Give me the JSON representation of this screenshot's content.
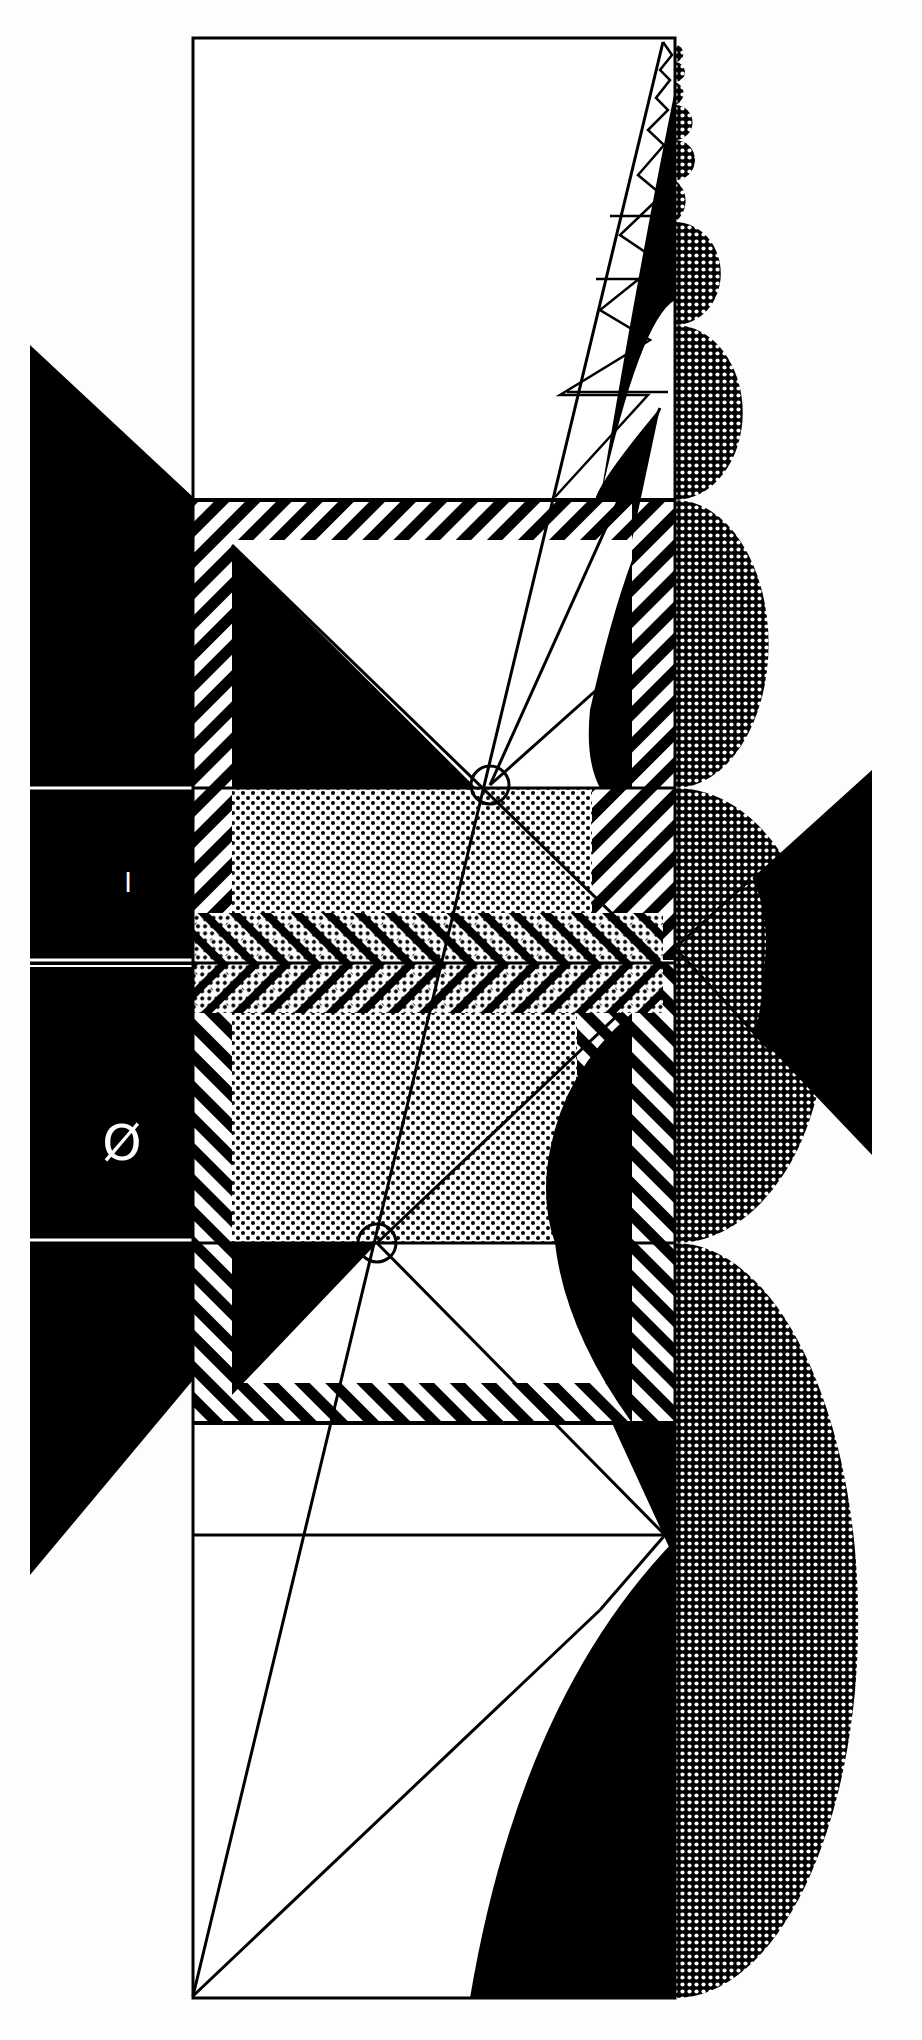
{
  "artwork": {
    "background": "#fdfdfd",
    "ink": "#000000",
    "paper": "#ffffff",
    "labels": {
      "upper_glyph": "I",
      "lower_glyph": "Ø"
    },
    "frame": {
      "left": 193,
      "right": 675,
      "top": 38,
      "bottom": 1998
    },
    "bands_y": [
      500,
      788,
      963,
      1243,
      1423,
      1535
    ],
    "left_black_panel": {
      "x": [
        30,
        193
      ],
      "y_top": 345,
      "y_bottom": 1575
    },
    "right_black_triangle": {
      "x": [
        758,
        872
      ],
      "apex_y": 948,
      "y_top": 770,
      "y_bottom": 1155
    },
    "circles": [
      {
        "cx": 490,
        "cy": 785,
        "r": 19
      },
      {
        "cx": 377,
        "cy": 1243,
        "r": 19
      }
    ],
    "textures": [
      "diagonal-hatch",
      "dot-screen",
      "crosshatch-screen",
      "chevron-hatch"
    ]
  }
}
